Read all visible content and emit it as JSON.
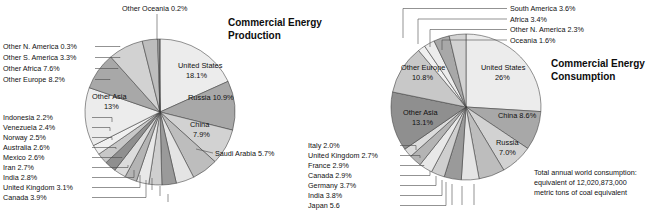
{
  "figure": {
    "background": "#ffffff",
    "stroke_color": "#3a3a3a"
  },
  "chart_data": [
    {
      "type": "pie",
      "id": "commercial-energy-production",
      "title": "Commercial Energy\nProduction",
      "title_line1": "Commercial Energy",
      "title_line2": "Production",
      "start_angle_deg": -90,
      "direction": "clockwise",
      "categories": [
        "United States",
        "Russia",
        "China",
        "Saudi Arabia",
        "Canada",
        "United Kingdom",
        "India",
        "Iran",
        "Mexico",
        "Australia",
        "Norway",
        "Venezuela",
        "Indonesia",
        "Other Asia",
        "Other Europe",
        "Other Africa",
        "Other S. America",
        "Other N. America",
        "Other Oceania"
      ],
      "values": [
        18.1,
        10.9,
        7.9,
        5.7,
        3.9,
        3.1,
        2.8,
        2.7,
        2.6,
        2.6,
        2.5,
        2.4,
        2.2,
        13.0,
        8.2,
        7.6,
        3.3,
        0.3,
        0.2
      ],
      "labels": [
        "United States 18.1%",
        "Russia 10.9%",
        "China 7.9%",
        "Saudi Arabia 5.7%",
        "Canada 3.9%",
        "United Kingdom 3.1%",
        "India 2.8%",
        "Iran 2.7%",
        "Mexico 2.6%",
        "Australia 2.6%",
        "Norway 2.5%",
        "Venezuela 2.4%",
        "Indonesia 2.2%",
        "Other Asia 13%",
        "Other Europe 8.2%",
        "Other Africa 7.6%",
        "Other S. America 3.3%",
        "Other N. America 0.3%",
        "Other Oceania 0.2%"
      ],
      "inside_labels": [
        {
          "name": "united-states",
          "line1": "United States",
          "line2": "18.1%"
        },
        {
          "name": "russia",
          "line1": "Russia 10.9%",
          "line2": ""
        },
        {
          "name": "china",
          "line1": "China",
          "line2": "7.9%"
        },
        {
          "name": "other-asia",
          "line1": "Other Asia",
          "line2": "13%"
        }
      ],
      "callout_labels_left_top": [
        "Other N. America 0.3%",
        "Other S. America 3.3%",
        "Other Africa 7.6%",
        "Other Europe 8.2%"
      ],
      "callout_labels_left_bottom": [
        "Indonesia 2.2%",
        "Venezuela 2.4%",
        "Norway 2.5%",
        "Australia 2.6%",
        "Mexico 2.6%",
        "Iran 2.7%",
        "India 2.8%",
        "United Kingdom 3.1%",
        "Canada 3.9%"
      ],
      "callout_label_top": "Other Oceania 0.2%",
      "callout_label_right": "Saudi Arabia 5.7%",
      "grid": false,
      "legend": "none"
    },
    {
      "type": "pie",
      "id": "commercial-energy-consumption",
      "title": "Commercial Energy\nConsumption",
      "title_line1": "Commercial Energy",
      "title_line2": "Consumption",
      "start_angle_deg": -90,
      "direction": "clockwise",
      "categories": [
        "United States",
        "China",
        "Russia",
        "Japan",
        "India",
        "Germany",
        "Canada",
        "France",
        "United Kingdom",
        "Italy",
        "Other Asia",
        "Other Europe",
        "Oceania",
        "Other N. America",
        "Africa",
        "South America"
      ],
      "values": [
        26.0,
        8.6,
        7.0,
        5.6,
        3.8,
        3.7,
        2.9,
        2.9,
        2.7,
        2.0,
        13.1,
        10.8,
        1.6,
        2.3,
        3.4,
        3.6
      ],
      "labels": [
        "United States 26%",
        "China 8.6%",
        "Russia 7.0%",
        "Japan 5.6",
        "India 3.8%",
        "Germany 3.7%",
        "Canada 2.9%",
        "France 2.9%",
        "United Kingdom 2.7%",
        "Italy 2.0%",
        "Other Asia 13.1%",
        "Other Europe 10.8%",
        "Oceania 1.6%",
        "Other N. America 2.3%",
        "Africa 3.4%",
        "South America 3.6%"
      ],
      "inside_labels": [
        {
          "name": "united-states",
          "line1": "United States",
          "line2": "26%"
        },
        {
          "name": "china",
          "line1": "China 8.6%",
          "line2": ""
        },
        {
          "name": "russia",
          "line1": "Russia",
          "line2": "7.0%"
        },
        {
          "name": "other-asia",
          "line1": "Other Asia",
          "line2": "13.1%"
        },
        {
          "name": "other-europe",
          "line1": "Other Europe",
          "line2": "10.8%"
        }
      ],
      "callout_labels_top_right": [
        "South America 3.6%",
        "Africa 3.4%",
        "Other N. America 2.3%",
        "Oceania 1.6%"
      ],
      "callout_labels_left_bottom": [
        "Italy 2.0%",
        "United Kingdom 2.7%",
        "France 2.9%",
        "Canada 2.9%",
        "Germany 3.7%",
        "India 3.8%",
        "Japan 5.6"
      ],
      "note_lines": [
        "Total annual world consumption:",
        "equivalent of 12,020,873,000",
        "metric tons of coal equivalent"
      ],
      "grid": false,
      "legend": "none"
    }
  ]
}
